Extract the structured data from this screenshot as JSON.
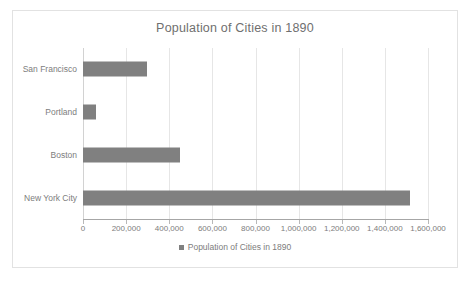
{
  "chart_data": {
    "type": "bar",
    "orientation": "horizontal",
    "title": "Population of Cities in 1890",
    "xlabel": "",
    "ylabel": "",
    "categories": [
      "San Francisco",
      "Portland",
      "Boston",
      "New York City"
    ],
    "values": [
      298997,
      58000,
      448477,
      1515301
    ],
    "series": [
      {
        "name": "Population of Cities in 1890",
        "values": [
          298997,
          58000,
          448477,
          1515301
        ]
      }
    ],
    "xlim": [
      0,
      1600000
    ],
    "xticks": [
      0,
      200000,
      400000,
      600000,
      800000,
      1000000,
      1200000,
      1400000,
      1600000
    ],
    "xtick_labels": [
      "0",
      "200,000",
      "400,000",
      "600,000",
      "800,000",
      "1,000,000",
      "1,200,000",
      "1,400,000",
      "1,600,000"
    ],
    "grid": "vertical",
    "legend": {
      "position": "bottom",
      "entries": [
        {
          "label": "Population of Cities in 1890",
          "color": "#808080",
          "marker": "square"
        }
      ]
    },
    "colors": {
      "bar": "#808080",
      "gridline": "#e6e6e6",
      "axis": "#a6a6a6",
      "text": "#7d7d7d",
      "title_text": "#6f6f6f",
      "frame_border": "#e2e2e2",
      "background": "#ffffff"
    }
  }
}
